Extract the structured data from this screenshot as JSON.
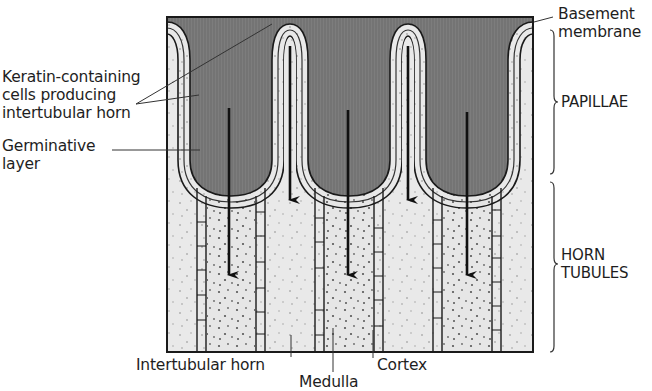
{
  "diagram": {
    "title": "",
    "colors": {
      "dermis": "#7b7b7b",
      "horn": "#e9e9e9",
      "outline": "#1a1a1a",
      "layer_band": "#9a9a9a"
    },
    "labels_left": {
      "keratin": [
        "Keratin-containing",
        "cells producing",
        "intertubular horn"
      ],
      "germinative": [
        "Germinative",
        "layer"
      ]
    },
    "labels_right": {
      "basement": [
        "Basement",
        "membrane"
      ],
      "papillae": "PAPILLAE",
      "horn_tubules": [
        "HORN",
        "TUBULES"
      ]
    },
    "labels_bottom": {
      "intertubular": "Intertubular horn",
      "medulla": "Medulla",
      "cortex": "Cortex"
    },
    "regions": [
      "Papillae",
      "Horn tubules"
    ],
    "papillae_count": 3,
    "growth_arrows": 5
  }
}
